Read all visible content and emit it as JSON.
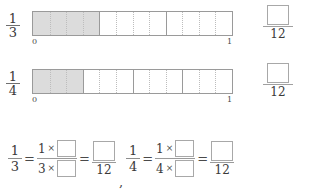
{
  "worksheet": {
    "denominator_common": "12",
    "times_symbol": "×",
    "equals_symbol": "=",
    "comma_symbol": ","
  },
  "rows": [
    {
      "label_numerator": "1",
      "label_denominator": "3",
      "start_label": "0",
      "end_label": "1",
      "total_segments": 12,
      "shaded_segments": 4,
      "major_divisions": 3,
      "answer_box_value": "",
      "answer_denominator": "12"
    },
    {
      "label_numerator": "1",
      "label_denominator": "4",
      "start_label": "0",
      "end_label": "1",
      "total_segments": 12,
      "shaded_segments": 3,
      "major_divisions": 4,
      "answer_box_value": "",
      "answer_denominator": "12"
    }
  ],
  "equations": [
    {
      "left_numerator": "1",
      "left_denominator": "3",
      "mid_num_factor": "1",
      "mid_num_box": "",
      "mid_den_factor": "3",
      "mid_den_box": "",
      "result_box": "",
      "result_denominator": "12"
    },
    {
      "left_numerator": "1",
      "left_denominator": "4",
      "mid_num_factor": "1",
      "mid_num_box": "",
      "mid_den_factor": "4",
      "mid_den_box": "",
      "result_box": "",
      "result_denominator": "12"
    }
  ],
  "colors": {
    "shade": "#dcdcdc",
    "outline": "#9a9a9a",
    "dotted": "#bdbdbd",
    "text": "#3a3a3a"
  }
}
